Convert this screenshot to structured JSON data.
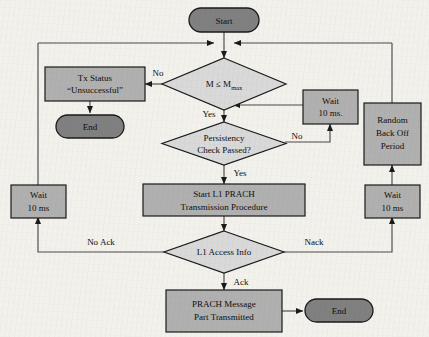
{
  "diagram": {
    "colors": {
      "terminal_fill": "#808080",
      "process_fill": "#b0b0b0",
      "decision_fill": "#d9d9d9",
      "stroke": "#000000",
      "background": "#f3f1ec",
      "line": "#4a4a4a"
    },
    "nodes": {
      "start": {
        "label": "Start",
        "shape": "terminal"
      },
      "decision_m": {
        "label_main": "M ≤ M",
        "label_sub": "max",
        "shape": "decision"
      },
      "tx_status": {
        "line1": "Tx Status",
        "line2": "“Unsuccessful”",
        "shape": "process"
      },
      "end_left": {
        "label": "End",
        "shape": "terminal"
      },
      "decision_persistency": {
        "line1": "Persistency",
        "line2": "Check Passed?",
        "shape": "decision"
      },
      "wait_mid_right": {
        "line1": "Wait",
        "line2": "10 ms.",
        "shape": "process"
      },
      "random_backoff": {
        "line1": "Random",
        "line2": "Back Off",
        "line3": "Period",
        "shape": "process"
      },
      "wait_right_lower": {
        "line1": "Wait",
        "line2": "10 ms",
        "shape": "process"
      },
      "wait_left": {
        "line1": "Wait",
        "line2": "10 ms",
        "shape": "process"
      },
      "start_l1_prach": {
        "line1": "Start L1 PRACH",
        "line2": "Transmission Procedure",
        "shape": "process"
      },
      "decision_l1_access": {
        "label": "L1 Access Info",
        "shape": "decision"
      },
      "prach_message": {
        "line1": "PRACH Message",
        "line2": "Part Transmitted",
        "shape": "process"
      },
      "end_bottom": {
        "label": "End",
        "shape": "terminal"
      }
    },
    "edge_labels": {
      "no_m": "No",
      "yes_m": "Yes",
      "no_persistency": "No",
      "yes_persistency": "Yes",
      "no_ack": "No Ack",
      "nack": "Nack",
      "ack": "Ack"
    }
  }
}
